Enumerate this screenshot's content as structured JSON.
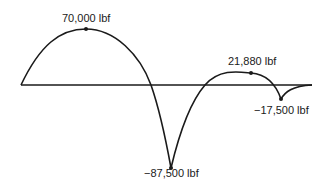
{
  "diagram": {
    "type": "moment/force diagram",
    "baseline": {
      "x_start": 21,
      "x_end": 312,
      "y": 85
    },
    "points": [
      {
        "id": "peak1",
        "value": "70,000 lbf",
        "x": 86,
        "y": 29
      },
      {
        "id": "min1",
        "value": "-87,500 lbf",
        "x": 171,
        "y": 168
      },
      {
        "id": "peak2",
        "value": "21,880 lbf",
        "x": 251,
        "y": 73
      },
      {
        "id": "min2",
        "value": "-17,500 lbf",
        "x": 281,
        "y": 99
      }
    ],
    "labels": {
      "peak1": "70,000 lbf",
      "min1": "−87,500 lbf",
      "peak2": "21,880 lbf",
      "min2": "−17,500 lbf"
    },
    "colors": {
      "line": "#1a1a1a",
      "background": "#ffffff"
    }
  }
}
